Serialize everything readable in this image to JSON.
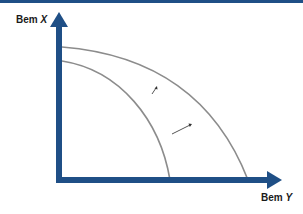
{
  "diagram": {
    "type": "production-possibilities-frontier-shift",
    "colors": {
      "axis": "#1f4f86",
      "top_border": "#1f4f86",
      "curve": "#8c8c8c",
      "shift_arrow": "#555555",
      "label": "#1a1a1a"
    },
    "axes": {
      "vertical": {
        "label_prefix": "Bem",
        "label_var": "X"
      },
      "horizontal": {
        "label_prefix": "Bem",
        "label_var": "Y"
      }
    },
    "curves": [
      {
        "name": "inner-frontier",
        "description": "original production possibilities frontier"
      },
      {
        "name": "outer-frontier",
        "description": "shifted production possibilities frontier"
      }
    ],
    "shift_arrows": [
      {
        "name": "shift-arrow-upper",
        "direction": "outward"
      },
      {
        "name": "shift-arrow-lower",
        "direction": "outward"
      }
    ]
  }
}
